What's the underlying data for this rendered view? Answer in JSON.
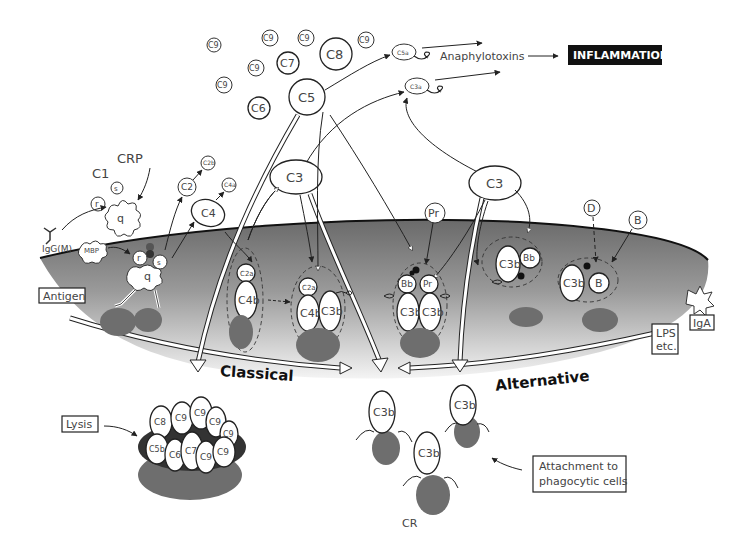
{
  "diagram": {
    "pathways": {
      "classical": "Classical",
      "alternative": "Alternative"
    },
    "outcomes": {
      "inflammation": "INFLAMMATION",
      "anaphylotoxins": "Anaphylotoxins",
      "lysis": "Lysis",
      "attachment": [
        "Attachment to",
        "phagocytic cells"
      ]
    },
    "triggers": {
      "antigen": "Antigen",
      "igg": "IgG(M)",
      "mbp": "MBP",
      "crp": "CRP",
      "c1": "C1",
      "lps": [
        "LPS",
        "etc."
      ],
      "iga": "IgA"
    },
    "c1_subunits": {
      "q": "q",
      "r": "r",
      "s": "s"
    },
    "fluid_components": {
      "c9_list": [
        "C9",
        "C9",
        "C9",
        "C9",
        "C9",
        "C9"
      ],
      "c8": "C8",
      "c7": "C7",
      "c6": "C6",
      "c5": "C5",
      "c5a": "C5a",
      "c3a": "C3a",
      "c3_classical": "C3",
      "c3_alternative": "C3",
      "c2": "C2",
      "c2b": "C2b",
      "c4": "C4",
      "c4a": "C4a",
      "pr": "Pr",
      "d": "D",
      "b": "B"
    },
    "membrane_complexes": {
      "c4b2a": {
        "top": "C2a",
        "bottom": "C4b"
      },
      "c4b2a3b": {
        "top": "C2a",
        "left": "C4b",
        "right": "C3b"
      },
      "properdin_convertase": {
        "tl": "Bb",
        "tr": "Pr",
        "bl": "C3b",
        "br": "C3b"
      },
      "c3bbb": {
        "left": "C3b",
        "right": "Bb"
      },
      "c3bb": {
        "left": "C3b",
        "right": "B"
      }
    },
    "mac": {
      "top_row": [
        "C8",
        "C9",
        "C9",
        "C9",
        "C9"
      ],
      "bottom_row": [
        "C5b",
        "C6",
        "C7",
        "C9",
        "C9"
      ]
    },
    "opsonins": {
      "c3b_list": [
        "C3b",
        "C3b",
        "C3b"
      ],
      "receptor": "CR"
    }
  }
}
